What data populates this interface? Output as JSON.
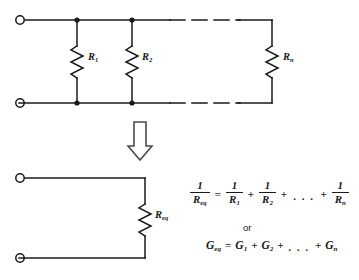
{
  "figure": {
    "line_color": "#1a1a1a",
    "background": "#ffffff"
  },
  "top_circuit": {
    "name": "parallel-resistor-network",
    "terminals": [
      {
        "name": "top-left-terminal",
        "x": 20,
        "y": 20
      },
      {
        "name": "bottom-left-terminal",
        "x": 20,
        "y": 103
      }
    ],
    "rails": {
      "top_y": 20,
      "bottom_y": 103,
      "solid_start_x": 26,
      "solid_end_x": 168,
      "dashed_start_x": 172,
      "dashed_end_x": 238,
      "right_x": 272
    },
    "junction_dots": [
      {
        "x": 77,
        "y": 20
      },
      {
        "x": 132,
        "y": 20
      },
      {
        "x": 77,
        "y": 103
      },
      {
        "x": 132,
        "y": 103
      }
    ],
    "resistors": [
      {
        "name": "resistor-r1",
        "label": "R",
        "subscript": "1",
        "x": 77
      },
      {
        "name": "resistor-r2",
        "label": "R",
        "subscript": "2",
        "x": 132
      },
      {
        "name": "resistor-rn",
        "label": "R",
        "subscript": "n",
        "x": 272
      }
    ]
  },
  "arrow": {
    "name": "transformation-arrow",
    "direction": "down",
    "x": 140,
    "y_top": 122,
    "y_bottom": 160
  },
  "bottom_circuit": {
    "name": "equivalent-resistor-circuit",
    "terminals": [
      {
        "name": "top-left-terminal",
        "x": 20,
        "y": 178
      },
      {
        "name": "bottom-left-terminal",
        "x": 20,
        "y": 258
      }
    ],
    "rails": {
      "top_y": 178,
      "bottom_y": 258,
      "left_x": 26,
      "right_x": 145
    },
    "resistor": {
      "name": "resistor-req",
      "label": "R",
      "subscript": "eq",
      "x": 145
    }
  },
  "equations": {
    "reciprocal": {
      "lhs": {
        "numerator": "1",
        "denominator": "R",
        "denominator_sub": "eq"
      },
      "equals": "=",
      "terms": [
        {
          "numerator": "1",
          "denominator": "R",
          "denominator_sub": "1"
        },
        {
          "numerator": "1",
          "denominator": "R",
          "denominator_sub": "2"
        },
        {
          "numerator": "1",
          "denominator": "R",
          "denominator_sub": "n"
        }
      ],
      "plus": "+",
      "ellipsis": ". . ."
    },
    "or_label": "or",
    "conductance": {
      "lhs": "G",
      "lhs_sub": "eq",
      "equals": "=",
      "term1": "G",
      "term1_sub": "1",
      "term2": "G",
      "term2_sub": "2",
      "termn": "G",
      "termn_sub": "n",
      "plus": "+",
      "ellipsis": ". . ."
    }
  }
}
